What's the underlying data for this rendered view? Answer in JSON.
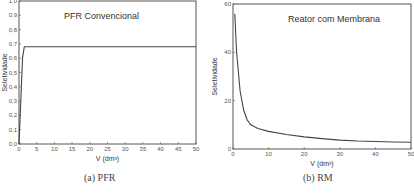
{
  "chart_data": [
    {
      "type": "line",
      "title": "PFR Convencional",
      "caption": "(a) PFR",
      "xlabel": "V (dm³)",
      "ylabel": "Seletividade",
      "xlim": [
        0,
        50
      ],
      "ylim": [
        0,
        1.0
      ],
      "xticks": [
        "0",
        "5",
        "10",
        "15",
        "20",
        "25",
        "30",
        "35",
        "40",
        "45",
        "50"
      ],
      "yticks": [
        "0,0",
        "0,1",
        "0,2",
        "0,3",
        "0,4",
        "0,5",
        "0,6",
        "0,7",
        "0,8",
        "0,9",
        "1,0"
      ],
      "grid": false,
      "x": [
        0,
        0.5,
        1,
        1.5,
        2,
        5,
        10,
        20,
        30,
        40,
        50
      ],
      "values": [
        0.0,
        0.3,
        0.6,
        0.68,
        0.68,
        0.68,
        0.68,
        0.68,
        0.68,
        0.68,
        0.68
      ]
    },
    {
      "type": "line",
      "title": "Reator com Membrana",
      "caption": "(b) RM",
      "xlabel": "V (dm³)",
      "ylabel": "Seletividade",
      "xlim": [
        0,
        50
      ],
      "ylim": [
        0,
        60
      ],
      "xticks": [
        "0",
        "10",
        "20",
        "30",
        "40",
        "50"
      ],
      "yticks": [
        "0",
        "20",
        "40",
        "60"
      ],
      "grid": false,
      "x": [
        0.5,
        1,
        2,
        3,
        4,
        5,
        7,
        10,
        15,
        20,
        25,
        30,
        35,
        40,
        45,
        50
      ],
      "values": [
        56,
        40,
        24,
        16,
        12,
        10,
        8.5,
        7.3,
        6,
        5,
        4.3,
        3.7,
        3.3,
        3.1,
        2.9,
        2.8
      ]
    }
  ]
}
